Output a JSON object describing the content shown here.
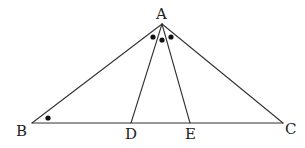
{
  "diagram": {
    "type": "geometry-triangle",
    "points": {
      "A": {
        "label": "A",
        "x": 162,
        "y": 24
      },
      "B": {
        "label": "B",
        "x": 32,
        "y": 123
      },
      "C": {
        "label": "C",
        "x": 283,
        "y": 123
      },
      "D": {
        "label": "D",
        "x": 131,
        "y": 123
      },
      "E": {
        "label": "E",
        "x": 190,
        "y": 123
      }
    },
    "segments": [
      {
        "from": "A",
        "to": "B"
      },
      {
        "from": "A",
        "to": "C"
      },
      {
        "from": "B",
        "to": "C"
      },
      {
        "from": "A",
        "to": "D"
      },
      {
        "from": "A",
        "to": "E"
      }
    ],
    "angle_marks": [
      {
        "vertex": "B",
        "x": 48,
        "y": 118
      },
      {
        "vertex": "A",
        "x": 153,
        "y": 37
      },
      {
        "vertex": "A",
        "x": 162,
        "y": 40
      },
      {
        "vertex": "A",
        "x": 171,
        "y": 37
      }
    ],
    "colors": {
      "line": "#333333",
      "text": "#222222",
      "mark": "#111111",
      "background": "#ffffff"
    }
  }
}
